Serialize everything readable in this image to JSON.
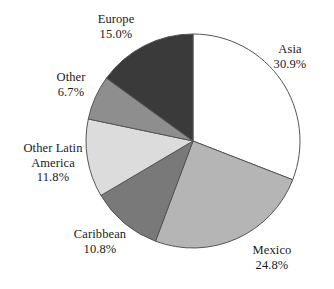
{
  "chart_data": {
    "type": "pie",
    "title": "",
    "subtitle": "",
    "xlabel": "",
    "ylabel": "",
    "legend_position": "none",
    "grid": false,
    "labels_outside": true,
    "start_angle_deg": 0,
    "direction": "clockwise",
    "categories": [
      "Asia",
      "Mexico",
      "Caribbean",
      "Other Latin America",
      "Other",
      "Europe"
    ],
    "values": [
      30.9,
      24.8,
      10.8,
      11.8,
      6.7,
      15.0
    ],
    "value_labels": [
      "30.9%",
      "24.8%",
      "10.8%",
      "11.8%",
      "6.7%",
      "15.0%"
    ],
    "units": "percent",
    "total": 100.0,
    "slices": [
      {
        "name": "Asia",
        "name_lines": [
          "Asia"
        ],
        "value": 30.9,
        "value_label": "30.9%",
        "color": "#ffffff",
        "stroke": "#555555"
      },
      {
        "name": "Mexico",
        "name_lines": [
          "Mexico"
        ],
        "value": 24.8,
        "value_label": "24.8%",
        "color": "#b5b5b5",
        "stroke": "#555555"
      },
      {
        "name": "Caribbean",
        "name_lines": [
          "Caribbean"
        ],
        "value": 10.8,
        "value_label": "10.8%",
        "color": "#797979",
        "stroke": "#555555"
      },
      {
        "name": "Other Latin America",
        "name_lines": [
          "Other Latin",
          "America"
        ],
        "value": 11.8,
        "value_label": "11.8%",
        "color": "#dcdcdc",
        "stroke": "#555555"
      },
      {
        "name": "Other",
        "name_lines": [
          "Other"
        ],
        "value": 6.7,
        "value_label": "6.7%",
        "color": "#8e8e8e",
        "stroke": "#555555"
      },
      {
        "name": "Europe",
        "name_lines": [
          "Europe"
        ],
        "value": 15.0,
        "value_label": "15.0%",
        "color": "#3a3a3a",
        "stroke": "#555555"
      }
    ]
  },
  "labels": {
    "europe": {
      "name": "Europe",
      "value": "15.0%"
    },
    "asia": {
      "name": "Asia",
      "value": "30.9%"
    },
    "mexico": {
      "name": "Mexico",
      "value": "24.8%"
    },
    "caribbean": {
      "name": "Caribbean",
      "value": "10.8%"
    },
    "other_latin_america": {
      "name_line1": "Other Latin",
      "name_line2": "America",
      "value": "11.8%"
    },
    "other": {
      "name": "Other",
      "value": "6.7%"
    }
  },
  "geometry": {
    "center_x": 193,
    "center_y": 141,
    "radius": 107
  },
  "colors": {
    "background": "#ffffff",
    "text": "#1a1a1a",
    "outline": "#555555"
  }
}
